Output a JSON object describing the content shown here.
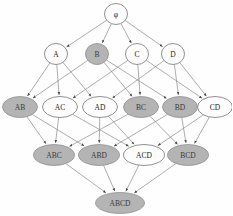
{
  "diagram": {
    "type": "hasse-diagram",
    "background_color": "#fefefe",
    "edge_color": "#8a8a8a",
    "node_fill_plain": "#fdfdfd",
    "node_fill_filled": "#b4b4b4",
    "node_stroke": "#6d6d6d",
    "label_color": "#2b2b2b",
    "levels": [
      {
        "index": 0,
        "name": "empty-set",
        "y": 14
      },
      {
        "index": 1,
        "name": "singletons",
        "y": 54
      },
      {
        "index": 2,
        "name": "pairs",
        "y": 107
      },
      {
        "index": 3,
        "name": "triples",
        "y": 155
      },
      {
        "index": 4,
        "name": "full-set",
        "y": 203
      }
    ],
    "nodes": [
      {
        "id": "empty",
        "label": "φ",
        "x": 116,
        "y": 14,
        "rx": 11.5,
        "ry": 10.5,
        "filled": false,
        "level": 0,
        "font_size": 7.5
      },
      {
        "id": "A",
        "label": "A",
        "x": 56,
        "y": 54,
        "rx": 11.5,
        "ry": 10.5,
        "filled": false,
        "level": 1,
        "font_size": 7.5
      },
      {
        "id": "B",
        "label": "B",
        "x": 97,
        "y": 54,
        "rx": 11.5,
        "ry": 10.5,
        "filled": true,
        "level": 1,
        "font_size": 7.5
      },
      {
        "id": "C",
        "label": "C",
        "x": 137,
        "y": 54,
        "rx": 11.5,
        "ry": 10.5,
        "filled": false,
        "level": 1,
        "font_size": 7.5
      },
      {
        "id": "D",
        "label": "D",
        "x": 173,
        "y": 54,
        "rx": 11.5,
        "ry": 10.5,
        "filled": false,
        "level": 1,
        "font_size": 7.5
      },
      {
        "id": "AB",
        "label": "AB",
        "x": 20,
        "y": 107,
        "rx": 17.5,
        "ry": 10.5,
        "filled": true,
        "level": 2,
        "font_size": 7.5
      },
      {
        "id": "AC",
        "label": "AC",
        "x": 60,
        "y": 107,
        "rx": 17.5,
        "ry": 10.5,
        "filled": false,
        "level": 2,
        "font_size": 7.5
      },
      {
        "id": "AD",
        "label": "AD",
        "x": 100,
        "y": 107,
        "rx": 17.5,
        "ry": 10.5,
        "filled": false,
        "level": 2,
        "font_size": 7.5
      },
      {
        "id": "BC",
        "label": "BC",
        "x": 141,
        "y": 107,
        "rx": 17.5,
        "ry": 10.5,
        "filled": true,
        "level": 2,
        "font_size": 7.5
      },
      {
        "id": "BD",
        "label": "BD",
        "x": 180,
        "y": 107,
        "rx": 17.5,
        "ry": 10.5,
        "filled": true,
        "level": 2,
        "font_size": 7.5
      },
      {
        "id": "CD",
        "label": "CD",
        "x": 215,
        "y": 107,
        "rx": 17.5,
        "ry": 10.5,
        "filled": false,
        "level": 2,
        "font_size": 7.5
      },
      {
        "id": "ABC",
        "label": "ABC",
        "x": 54,
        "y": 155,
        "rx": 20.5,
        "ry": 10.5,
        "filled": true,
        "level": 3,
        "font_size": 7.5
      },
      {
        "id": "ABD",
        "label": "ABD",
        "x": 99,
        "y": 155,
        "rx": 20.5,
        "ry": 10.5,
        "filled": true,
        "level": 3,
        "font_size": 7.5
      },
      {
        "id": "ACD",
        "label": "ACD",
        "x": 144,
        "y": 155,
        "rx": 20.5,
        "ry": 10.5,
        "filled": false,
        "level": 3,
        "font_size": 7.5
      },
      {
        "id": "BCD",
        "label": "BCD",
        "x": 188,
        "y": 155,
        "rx": 20.5,
        "ry": 10.5,
        "filled": true,
        "level": 3,
        "font_size": 7.5
      },
      {
        "id": "ABCD",
        "label": "ABCD",
        "x": 120,
        "y": 203,
        "rx": 24.5,
        "ry": 10.5,
        "filled": true,
        "level": 4,
        "font_size": 7.5
      }
    ],
    "edges": [
      {
        "from": "empty",
        "to": "A"
      },
      {
        "from": "empty",
        "to": "B"
      },
      {
        "from": "empty",
        "to": "C"
      },
      {
        "from": "empty",
        "to": "D"
      },
      {
        "from": "A",
        "to": "AB"
      },
      {
        "from": "A",
        "to": "AC"
      },
      {
        "from": "A",
        "to": "AD"
      },
      {
        "from": "B",
        "to": "AB"
      },
      {
        "from": "B",
        "to": "BC"
      },
      {
        "from": "B",
        "to": "BD"
      },
      {
        "from": "C",
        "to": "AC"
      },
      {
        "from": "C",
        "to": "BC"
      },
      {
        "from": "C",
        "to": "CD"
      },
      {
        "from": "D",
        "to": "AD"
      },
      {
        "from": "D",
        "to": "BD"
      },
      {
        "from": "D",
        "to": "CD"
      },
      {
        "from": "AB",
        "to": "ABC"
      },
      {
        "from": "AB",
        "to": "ABD"
      },
      {
        "from": "AC",
        "to": "ABC"
      },
      {
        "from": "AC",
        "to": "ACD"
      },
      {
        "from": "AD",
        "to": "ABD"
      },
      {
        "from": "AD",
        "to": "ACD"
      },
      {
        "from": "BC",
        "to": "ABC"
      },
      {
        "from": "BC",
        "to": "BCD"
      },
      {
        "from": "BD",
        "to": "ABD"
      },
      {
        "from": "BD",
        "to": "BCD"
      },
      {
        "from": "CD",
        "to": "ACD"
      },
      {
        "from": "CD",
        "to": "BCD"
      },
      {
        "from": "ABC",
        "to": "ABCD"
      },
      {
        "from": "ABD",
        "to": "ABCD"
      },
      {
        "from": "ACD",
        "to": "ABCD"
      },
      {
        "from": "BCD",
        "to": "ABCD"
      }
    ]
  }
}
